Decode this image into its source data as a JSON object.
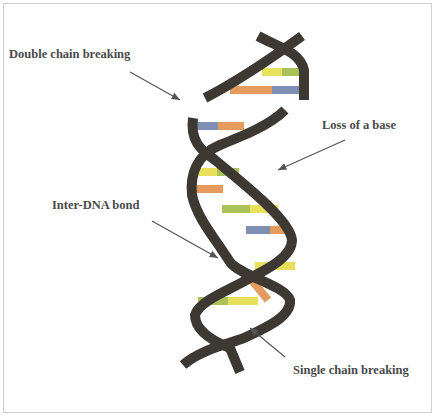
{
  "labels": {
    "double_chain": "Double chain breaking",
    "loss_base": "Loss of a base",
    "inter_dna": "Inter-DNA bond",
    "single_chain": "Single chain breaking"
  },
  "colors": {
    "strand": "#3d3832",
    "yellow": "#e8e05a",
    "green": "#a9c35a",
    "orange": "#e59a5e",
    "blue": "#7f8fb3",
    "arrow": "#555555",
    "text": "#4a4a4a"
  }
}
